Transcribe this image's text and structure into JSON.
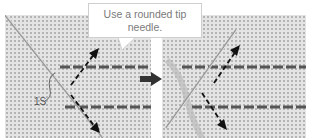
{
  "figure": {
    "callout": {
      "line1": "Use a rounded tip",
      "line2": "needle."
    },
    "label": "1S",
    "panels": [
      {
        "name": "before",
        "description": "Needle inserted diagonally with stitch direction arrows"
      },
      {
        "name": "after",
        "description": "Needle angled opposite direction with stitch direction arrows"
      }
    ],
    "icons": {
      "step_arrow": "right-arrow-icon",
      "direction_arrows": "dashed-arrow-icon"
    },
    "colors": {
      "fabric": "#e4e4e4",
      "weave": "#b4b4b4",
      "thread": "#444444",
      "arrow": "#111111",
      "callout_text": "#7a7a7a"
    }
  }
}
